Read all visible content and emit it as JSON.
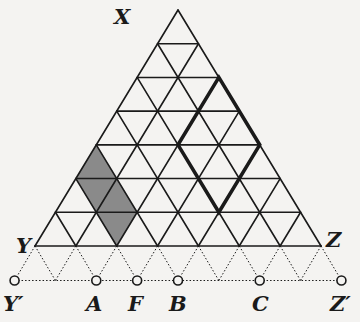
{
  "figure": {
    "labels": {
      "X": "X",
      "Y": "Y",
      "Z": "Z",
      "Y_prime": "Y′",
      "A": "A",
      "F": "F",
      "B": "B",
      "C": "C",
      "Z_prime": "Z′"
    },
    "grid": {
      "rows": 7,
      "type": "triangular"
    },
    "colors": {
      "line": "#1a1a1a",
      "shade": "#8a8a8a",
      "background": "#f4f3f1"
    },
    "shaded_region": "parallelogram of 4 unit triangles on left side (rows 5-7)",
    "highlighted_region": "thick rhombus on right side (rows 3-6)"
  }
}
